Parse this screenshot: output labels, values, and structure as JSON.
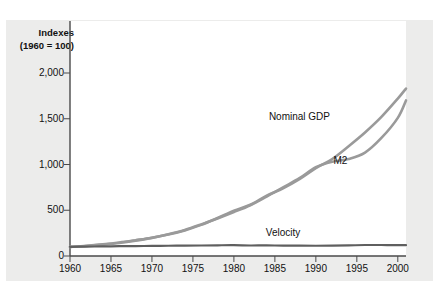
{
  "chart_data": {
    "type": "line",
    "title": "Indexes",
    "subtitle": "(1960 = 100)",
    "xlabel": "",
    "ylabel": "",
    "xlim": [
      1960,
      2001
    ],
    "ylim": [
      0,
      2100
    ],
    "yticks": [
      "0",
      "500",
      "1,000",
      "1,500",
      "2,000"
    ],
    "ytick_values": [
      0,
      500,
      1000,
      1500,
      2000
    ],
    "xticks": [
      "1960",
      "1965",
      "1970",
      "1975",
      "1980",
      "1985",
      "1990",
      "1995",
      "2000"
    ],
    "xtick_values": [
      1960,
      1965,
      1970,
      1975,
      1980,
      1985,
      1990,
      1995,
      2000
    ],
    "grid": false,
    "legend": "inline-annotations",
    "x": [
      1960,
      1962,
      1964,
      1966,
      1968,
      1970,
      1972,
      1974,
      1976,
      1978,
      1980,
      1982,
      1984,
      1986,
      1988,
      1990,
      1992,
      1994,
      1996,
      1998,
      2000,
      2001
    ],
    "series": [
      {
        "name": "Nominal GDP",
        "color": "#9a9a9a",
        "values": [
          100,
          112,
          128,
          148,
          173,
          200,
          235,
          280,
          340,
          415,
          495,
          560,
          660,
          740,
          840,
          960,
          1060,
          1200,
          1350,
          1520,
          1720,
          1830
        ]
      },
      {
        "name": "M2",
        "color": "#9a9a9a",
        "values": [
          100,
          110,
          125,
          143,
          168,
          198,
          238,
          285,
          345,
          410,
          480,
          555,
          650,
          750,
          850,
          970,
          1030,
          1060,
          1130,
          1290,
          1510,
          1700
        ]
      },
      {
        "name": "Velocity",
        "color": "#5f5f5f",
        "values": [
          100,
          103,
          105,
          107,
          109,
          110,
          112,
          113,
          115,
          117,
          118,
          115,
          116,
          113,
          114,
          112,
          113,
          116,
          120,
          120,
          118,
          118
        ]
      }
    ],
    "annotations": [
      {
        "text": "Nominal GDP",
        "x": 1988,
        "y": 1520
      },
      {
        "text": "M2",
        "x": 1993,
        "y": 1035
      },
      {
        "text": "Velocity",
        "x": 1986,
        "y": 255
      }
    ]
  },
  "colors": {
    "figure_background": "#ececeb",
    "plot_background": "#ffffff",
    "axis": "#4a4a4a",
    "text": "#111111",
    "gdp_m2_line": "#9a9a9a",
    "velocity_line": "#5f5f5f"
  }
}
